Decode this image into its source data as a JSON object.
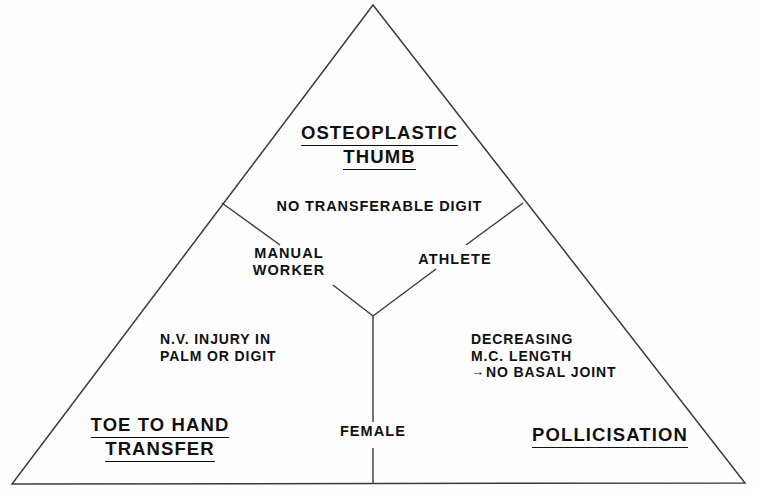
{
  "diagram": {
    "type": "triangle-decision-diagram",
    "title_text": "",
    "stroke_color": "#3a3a3a",
    "text_color": "#111111",
    "background": "#fefefe",
    "corners": {
      "apex": {
        "id": "osteoplastic-thumb",
        "line1": "OSTEOPLASTIC",
        "line2": "THUMB",
        "underlined": true
      },
      "bottom_left": {
        "id": "toe-to-hand-transfer",
        "line1": "TOE  TO HAND",
        "line2": "TRANSFER",
        "underlined": true
      },
      "bottom_right": {
        "id": "pollicisation",
        "line1": "POLLICISATION",
        "underlined": true
      }
    },
    "conditions": {
      "top_branch": "NO TRANSFERABLE  DIGIT",
      "left_node": {
        "line1": "MANUAL",
        "line2": "WORKER"
      },
      "right_node": {
        "line1": "ATHLETE"
      },
      "bottom_node": {
        "line1": "FEMALE"
      },
      "left_region": {
        "line1": "N.V. INJURY IN",
        "line2": "PALM OR DIGIT"
      },
      "right_region": {
        "line1": "DECREASING",
        "line2": "M.C. LENGTH",
        "line3_arrow": "→",
        "line3": "NO BASAL JOINT"
      }
    },
    "geometry": {
      "apex": [
        373,
        5
      ],
      "bottom_left": [
        12,
        484
      ],
      "bottom_right": [
        745,
        483
      ],
      "y_center": [
        373,
        316
      ],
      "left_branch_top": [
        222,
        203
      ],
      "right_branch_top": [
        523,
        203
      ]
    }
  }
}
